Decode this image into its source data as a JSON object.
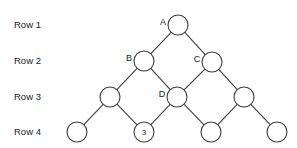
{
  "diagram": {
    "type": "lattice-graph",
    "width": 297,
    "height": 148,
    "background_color": "#ffffff",
    "stroke_color": "#3c3c3c",
    "text_color": "#1a1a1a",
    "node_radius": 10,
    "row_labels": [
      {
        "id": "row1",
        "text": "Row 1",
        "x": 14,
        "y": 25
      },
      {
        "id": "row2",
        "text": "Row 2",
        "x": 14,
        "y": 61
      },
      {
        "id": "row3",
        "text": "Row 3",
        "x": 14,
        "y": 97
      },
      {
        "id": "row4",
        "text": "Row 4",
        "x": 14,
        "y": 132
      }
    ],
    "nodes": [
      {
        "id": "n-a",
        "row": 1,
        "cx": 178,
        "cy": 25,
        "label": "A",
        "label_position": "left",
        "label_x": 163,
        "label_y": 23
      },
      {
        "id": "n-b",
        "row": 2,
        "cx": 144,
        "cy": 61,
        "label": "B",
        "label_position": "left",
        "label_x": 129,
        "label_y": 59
      },
      {
        "id": "n-c",
        "row": 2,
        "cx": 212,
        "cy": 62,
        "label": "C",
        "label_position": "left",
        "label_x": 197,
        "label_y": 60
      },
      {
        "id": "n-r3a",
        "row": 3,
        "cx": 110,
        "cy": 97,
        "label": "",
        "label_position": "none",
        "label_x": 0,
        "label_y": 0
      },
      {
        "id": "n-d",
        "row": 3,
        "cx": 177,
        "cy": 97,
        "label": "D",
        "label_position": "left",
        "label_x": 162,
        "label_y": 95
      },
      {
        "id": "n-r3c",
        "row": 3,
        "cx": 244,
        "cy": 97,
        "label": "",
        "label_position": "none",
        "label_x": 0,
        "label_y": 0
      },
      {
        "id": "n-r4a",
        "row": 4,
        "cx": 77,
        "cy": 132,
        "label": "",
        "label_position": "none",
        "label_x": 0,
        "label_y": 0
      },
      {
        "id": "n-r4b",
        "row": 4,
        "cx": 144,
        "cy": 132,
        "label": "3",
        "label_position": "inside",
        "label_x": 144,
        "label_y": 132
      },
      {
        "id": "n-r4c",
        "row": 4,
        "cx": 211,
        "cy": 132,
        "label": "",
        "label_position": "none",
        "label_x": 0,
        "label_y": 0
      },
      {
        "id": "n-r4d",
        "row": 4,
        "cx": 277,
        "cy": 132,
        "label": "",
        "label_position": "none",
        "label_x": 0,
        "label_y": 0
      }
    ],
    "edges": [
      {
        "id": "e-a-b",
        "from": "n-a",
        "to": "n-b"
      },
      {
        "id": "e-a-c",
        "from": "n-a",
        "to": "n-c"
      },
      {
        "id": "e-b-r3a",
        "from": "n-b",
        "to": "n-r3a"
      },
      {
        "id": "e-b-d",
        "from": "n-b",
        "to": "n-d"
      },
      {
        "id": "e-c-d",
        "from": "n-c",
        "to": "n-d"
      },
      {
        "id": "e-c-r3c",
        "from": "n-c",
        "to": "n-r3c"
      },
      {
        "id": "e-r3a-r4a",
        "from": "n-r3a",
        "to": "n-r4a"
      },
      {
        "id": "e-r3a-r4b",
        "from": "n-r3a",
        "to": "n-r4b"
      },
      {
        "id": "e-d-r4b",
        "from": "n-d",
        "to": "n-r4b"
      },
      {
        "id": "e-d-r4c",
        "from": "n-d",
        "to": "n-r4c"
      },
      {
        "id": "e-r3c-r4c",
        "from": "n-r3c",
        "to": "n-r4c"
      },
      {
        "id": "e-r3c-r4d",
        "from": "n-r3c",
        "to": "n-r4d"
      }
    ]
  }
}
